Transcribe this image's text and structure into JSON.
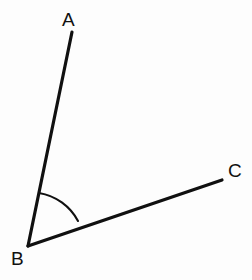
{
  "figure": {
    "kind": "angle-diagram",
    "background_color": "#fdfdfd",
    "stroke_color": "#101010",
    "label_color": "#111111",
    "canvas": {
      "width": 252,
      "height": 280
    },
    "labels": {
      "a": "A",
      "b": "B",
      "c": "C"
    },
    "points": {
      "A": {
        "x": 72,
        "y": 32
      },
      "B": {
        "x": 28,
        "y": 246
      },
      "C": {
        "x": 222,
        "y": 180
      }
    },
    "rays": [
      {
        "name": "ray-BA",
        "from": "B",
        "to": "A",
        "stroke_width": 3.2
      },
      {
        "name": "ray-BC",
        "from": "B",
        "to": "C",
        "stroke_width": 3.2
      }
    ],
    "arc": {
      "name": "angle-arc-ABC",
      "center": "B",
      "radius": 54,
      "start": {
        "x": 39,
        "y": 193
      },
      "end": {
        "x": 78,
        "y": 221
      },
      "stroke_width": 2.1
    }
  }
}
